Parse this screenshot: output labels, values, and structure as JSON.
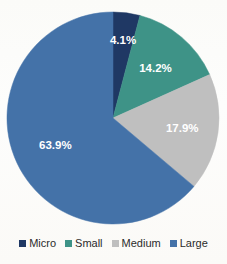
{
  "chart_data": {
    "type": "pie",
    "title": "",
    "xlabel": "",
    "ylabel": "",
    "categories": [
      "Micro",
      "Small",
      "Medium",
      "Large"
    ],
    "values": [
      4.1,
      14.2,
      17.9,
      63.9
    ],
    "value_labels": [
      "4.1%",
      "14.2%",
      "17.9%",
      "63.9%"
    ],
    "colors": [
      "#1F3864",
      "#3E9387",
      "#BFBFBF",
      "#4472A8"
    ],
    "label_color": "#FFFFFF",
    "units": "percent",
    "start_angle_deg": 0,
    "direction": "clockwise",
    "grid": false,
    "legend_position": "bottom",
    "legend": [
      {
        "label": "Micro",
        "color": "#1F3864"
      },
      {
        "label": "Small",
        "color": "#3E9387"
      },
      {
        "label": "Medium",
        "color": "#BFBFBF"
      },
      {
        "label": "Large",
        "color": "#4472A8"
      }
    ]
  },
  "geometry": {
    "cx": 113,
    "cy": 118,
    "r": 106,
    "label_radius_fraction": 0.66
  }
}
